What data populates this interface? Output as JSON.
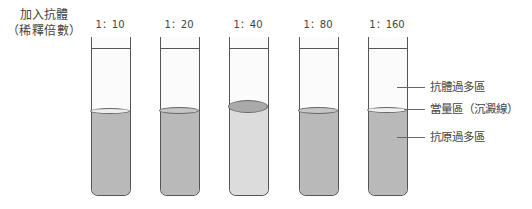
{
  "header": {
    "line1": "加入抗體",
    "line2": "（稀釋倍數）"
  },
  "tubes": [
    {
      "ratio": "1：10",
      "left": 91,
      "liquid_color": "#b9b9b9",
      "meniscus_color": "#eeeeee",
      "meniscus_top": 71,
      "meniscus_height": 6,
      "liquid_top": 74
    },
    {
      "ratio": "1：20",
      "left": 160,
      "liquid_color": "#b9b9b9",
      "meniscus_color": "#c6c6c6",
      "meniscus_top": 70,
      "meniscus_height": 7,
      "liquid_top": 74
    },
    {
      "ratio": "1：40",
      "left": 229,
      "liquid_color": "#dcdcdc",
      "meniscus_color": "#a9a9a9",
      "meniscus_top": 63,
      "meniscus_height": 13,
      "liquid_top": 70
    },
    {
      "ratio": "1：80",
      "left": 299,
      "liquid_color": "#b9b9b9",
      "meniscus_color": "#c6c6c6",
      "meniscus_top": 70,
      "meniscus_height": 7,
      "liquid_top": 74
    },
    {
      "ratio": "1：160",
      "left": 368,
      "liquid_color": "#b9b9b9",
      "meniscus_color": "#efefef",
      "meniscus_top": 70,
      "meniscus_height": 6,
      "liquid_top": 73
    }
  ],
  "legend": [
    {
      "label": "抗體過多區",
      "y": 87
    },
    {
      "label": "當量區（沉澱線）",
      "y": 109
    },
    {
      "label": "抗原過多區",
      "y": 137
    }
  ],
  "colors": {
    "outline": "#555555",
    "liquid_gray": "#b9b9b9",
    "liquid_light": "#dcdcdc",
    "precipitate": "#a9a9a9"
  }
}
